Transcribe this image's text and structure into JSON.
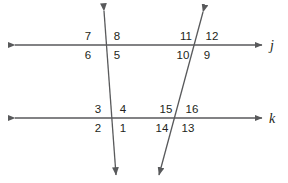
{
  "figure": {
    "background_color": "#ffffff",
    "stroke_color": "#58595b",
    "text_color": "#231f20",
    "parallel_lines": [
      {
        "id": "line-j",
        "label": "j",
        "y": 45,
        "x_start": 15,
        "x_end": 262,
        "label_x": 272,
        "label_y": 50
      },
      {
        "id": "line-k",
        "label": "k",
        "y": 118,
        "x_start": 15,
        "x_end": 262,
        "label_x": 272,
        "label_y": 123
      }
    ],
    "transversals": [
      {
        "id": "transversal-1",
        "x_top": 104,
        "y_top": 11,
        "x_bottom": 116,
        "y_bottom": 175
      },
      {
        "id": "transversal-2",
        "x_top": 203,
        "y_top": 12,
        "x_bottom": 159,
        "y_bottom": 175
      }
    ],
    "intersections": [
      {
        "id": "intersection-j-t1",
        "line": "j",
        "transversal": "transversal-1",
        "x": 106,
        "y": 45
      },
      {
        "id": "intersection-j-t2",
        "line": "j",
        "transversal": "transversal-2",
        "x": 197,
        "y": 45
      },
      {
        "id": "intersection-k-t1",
        "line": "k",
        "transversal": "transversal-1",
        "x": 112,
        "y": 118
      },
      {
        "id": "intersection-k-t2",
        "line": "k",
        "transversal": "transversal-2",
        "x": 176,
        "y": 118
      }
    ],
    "angle_labels": [
      {
        "id": "angle-7",
        "text": "7",
        "x": 88,
        "y": 40,
        "anchor": "middle",
        "position": "above-left",
        "intersection": "intersection-j-t1"
      },
      {
        "id": "angle-8",
        "text": "8",
        "x": 117,
        "y": 40,
        "anchor": "middle",
        "position": "above-right",
        "intersection": "intersection-j-t1"
      },
      {
        "id": "angle-6",
        "text": "6",
        "x": 88,
        "y": 59,
        "anchor": "middle",
        "position": "below-left",
        "intersection": "intersection-j-t1"
      },
      {
        "id": "angle-5",
        "text": "5",
        "x": 117,
        "y": 59,
        "anchor": "middle",
        "position": "below-right",
        "intersection": "intersection-j-t1"
      },
      {
        "id": "angle-11",
        "text": "11",
        "x": 186,
        "y": 40,
        "anchor": "middle",
        "position": "above-left",
        "intersection": "intersection-j-t2"
      },
      {
        "id": "angle-12",
        "text": "12",
        "x": 212,
        "y": 40,
        "anchor": "middle",
        "position": "above-right",
        "intersection": "intersection-j-t2"
      },
      {
        "id": "angle-10",
        "text": "10",
        "x": 183,
        "y": 59,
        "anchor": "middle",
        "position": "below-left",
        "intersection": "intersection-j-t2"
      },
      {
        "id": "angle-9",
        "text": "9",
        "x": 207,
        "y": 59,
        "anchor": "middle",
        "position": "below-right",
        "intersection": "intersection-j-t2"
      },
      {
        "id": "angle-3",
        "text": "3",
        "x": 98,
        "y": 113,
        "anchor": "middle",
        "position": "above-left",
        "intersection": "intersection-k-t1"
      },
      {
        "id": "angle-4",
        "text": "4",
        "x": 123,
        "y": 113,
        "anchor": "middle",
        "position": "above-right",
        "intersection": "intersection-k-t1"
      },
      {
        "id": "angle-2",
        "text": "2",
        "x": 98,
        "y": 132,
        "anchor": "middle",
        "position": "below-left",
        "intersection": "intersection-k-t1"
      },
      {
        "id": "angle-1",
        "text": "1",
        "x": 123,
        "y": 132,
        "anchor": "middle",
        "position": "below-right",
        "intersection": "intersection-k-t1"
      },
      {
        "id": "angle-15",
        "text": "15",
        "x": 166,
        "y": 113,
        "anchor": "middle",
        "position": "above-left",
        "intersection": "intersection-k-t2"
      },
      {
        "id": "angle-16",
        "text": "16",
        "x": 192,
        "y": 113,
        "anchor": "middle",
        "position": "above-right",
        "intersection": "intersection-k-t2"
      },
      {
        "id": "angle-14",
        "text": "14",
        "x": 162,
        "y": 132,
        "anchor": "middle",
        "position": "below-left",
        "intersection": "intersection-k-t2"
      },
      {
        "id": "angle-13",
        "text": "13",
        "x": 188,
        "y": 132,
        "anchor": "middle",
        "position": "below-right",
        "intersection": "intersection-k-t2"
      }
    ]
  }
}
